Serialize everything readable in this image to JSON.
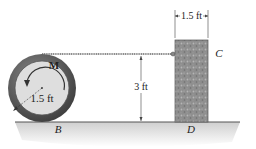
{
  "diagram": {
    "type": "statics-friction-problem",
    "labels": {
      "moment": "M",
      "wheel_radius": "1.5 ft",
      "block_width": "1.5 ft",
      "cable_height": "3 ft",
      "point_block_top": "C",
      "point_block_bottom": "D",
      "point_wheel_contact": "B"
    },
    "colors": {
      "wheel_rim": "#5a5a5a",
      "wheel_hub": "#dcdcdc",
      "block": "#8c8c8c",
      "ground_line": "#444444",
      "ground_shade": "#d9d9d9",
      "cable": "#777777"
    }
  }
}
